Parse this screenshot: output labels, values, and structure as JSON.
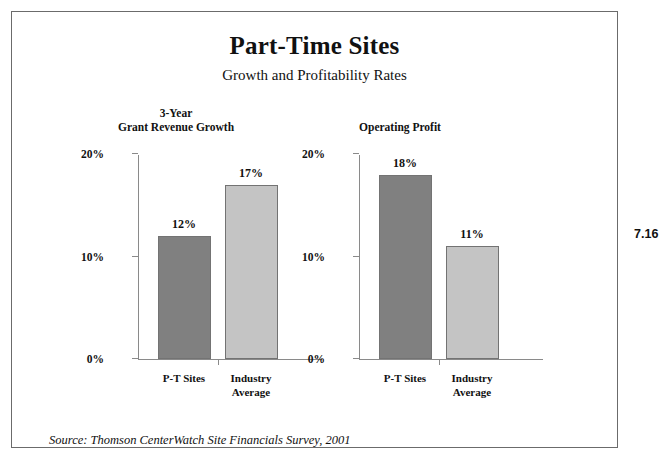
{
  "figure": {
    "number": "7.16",
    "source_note": "Source: Thomson CenterWatch Site Financials Survey, 2001"
  },
  "chart_data": [
    {
      "type": "bar",
      "title": "3-Year\nGrant Revenue Growth",
      "categories": [
        "P-T Sites",
        "Industry\nAverage"
      ],
      "values": [
        12,
        17
      ],
      "value_labels": [
        "12%",
        "17%"
      ],
      "colors": [
        "#808080",
        "#c4c4c4"
      ],
      "xlabel": "",
      "ylabel": "",
      "ylim": [
        0,
        20
      ],
      "yticks": [
        0,
        10,
        20
      ],
      "ytick_labels": [
        "0%",
        "10%",
        "20%"
      ],
      "grid": false,
      "legend": "none"
    },
    {
      "type": "bar",
      "title": "Operating Profit",
      "categories": [
        "P-T Sites",
        "Industry\nAverage"
      ],
      "values": [
        18,
        11
      ],
      "value_labels": [
        "18%",
        "11%"
      ],
      "colors": [
        "#808080",
        "#c4c4c4"
      ],
      "xlabel": "",
      "ylabel": "",
      "ylim": [
        0,
        20
      ],
      "yticks": [
        0,
        10,
        20
      ],
      "ytick_labels": [
        "0%",
        "10%",
        "20%"
      ],
      "grid": false,
      "legend": "none"
    }
  ],
  "header": {
    "title": "Part-Time Sites",
    "subtitle": "Growth and Profitability Rates"
  }
}
